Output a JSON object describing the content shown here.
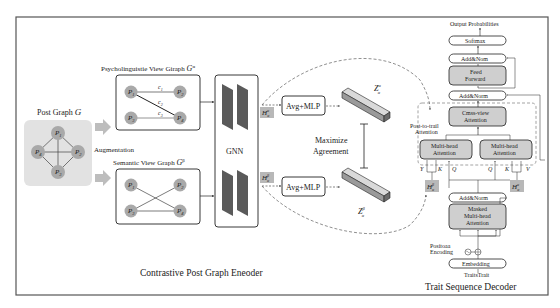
{
  "encoder": {
    "title": "Contrastive Post Graph Eneoder",
    "post_graph": {
      "label": "Post Graph",
      "symbol": "G",
      "nodes": [
        "P1",
        "P2",
        "P3",
        "P4"
      ]
    },
    "augmentation_label": "Augmentation",
    "psych_view": {
      "label": "Psycholinguistie View Giraph",
      "symbol": "G",
      "sup": "α",
      "nodes": [
        "P1",
        "P2",
        "P3",
        "P4"
      ],
      "edge_labels": [
        "c1",
        "c2",
        "c3"
      ]
    },
    "semantic_view": {
      "label": "Semantic View Graph",
      "symbol": "G",
      "sup": "β",
      "nodes": [
        "P1",
        "P2",
        "P3",
        "P4"
      ]
    },
    "gnn_label": "GNN",
    "h_alpha": {
      "base": "H",
      "sup": "α",
      "sub": "α"
    },
    "h_beta": {
      "base": "H",
      "sup": "β",
      "sub": "α"
    },
    "avg_mlp_top": "Avg+MLP",
    "avg_mlp_bottom": "Avg+MLP",
    "z_alpha": {
      "base": "Z",
      "sup": "α",
      "sub": "α"
    },
    "z_beta": {
      "base": "Z",
      "sup": "β",
      "sub": "α"
    },
    "maximize_line1": "Maximize",
    "maximize_line2": "Agreement"
  },
  "decoder": {
    "title": "Trait Sequence Decoder",
    "output_label": "Output Probabilities",
    "softmax": "Softmax",
    "add_norm_top": "Add&Nom",
    "feed_forward_l1": "Feed",
    "feed_forward_l2": "Forward",
    "add_norm_mid": "Add&Norm",
    "post_to_trait_l1": "Post-to-trail",
    "post_to_trait_l2": "Attention",
    "cross_view_l1": "Cmss-view",
    "cross_view_l2": "Attention",
    "mha_left_l1": "Multi-head",
    "mha_left_l2": "Attention",
    "mha_right_l1": "Multi-head",
    "mha_right_l2": "Attention",
    "left_v": "Y",
    "left_k": "K",
    "left_q": "Q",
    "right_q": "Q",
    "right_k": "K",
    "right_v": "V",
    "h_beta": {
      "base": "H",
      "sup": "β",
      "sub": "α"
    },
    "h_alpha": {
      "base": "H",
      "sup": "α",
      "sub": "α"
    },
    "add_norm_low": "Add&Norm",
    "masked_l1": "Masked",
    "masked_l2": "Multi-head",
    "masked_l3": "Attention",
    "pos_enc_l1": "Positoaa",
    "pos_enc_l2": "Encoding",
    "embedding": "Embedding",
    "input_label": "TraitsTrait"
  },
  "colors": {
    "frame": "#555555",
    "node_fill": "#a9a9a9",
    "graph_bg": "#e2e2e2",
    "gnn_bar": "#5a5a5a",
    "box_fill": "#cfcfcf",
    "h_fill": "#b8b8b8",
    "arrow_gray": "#bdbdbd"
  }
}
